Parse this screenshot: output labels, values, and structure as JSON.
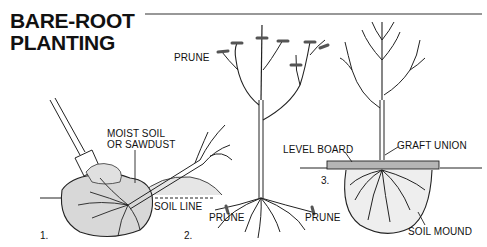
{
  "title": {
    "line1": "BARE-ROOT",
    "line2": "PLANTING"
  },
  "steps": [
    {
      "number": "1.",
      "labels": {
        "moist_soil_1": "MOIST SOIL",
        "moist_soil_2": "OR SAWDUST",
        "soil_line": "SOIL LINE"
      }
    },
    {
      "number": "2.",
      "labels": {
        "prune_top": "PRUNE",
        "prune_root_left": "PRUNE",
        "prune_root_right": "PRUNE"
      }
    },
    {
      "number": "3.",
      "labels": {
        "level_board": "LEVEL BOARD",
        "graft_union": "GRAFT UNION",
        "soil_mound": "SOIL MOUND"
      }
    }
  ],
  "colors": {
    "ink": "#111111",
    "board": "#b5b5b5",
    "soil_shade": "#cfcfcf"
  }
}
